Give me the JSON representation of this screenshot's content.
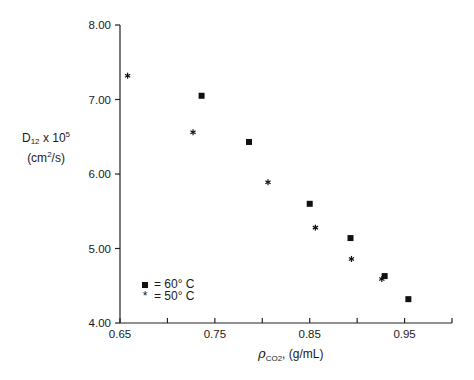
{
  "chart_data": {
    "type": "scatter",
    "title": "",
    "xlabel": "ρCO2, (g/mL)",
    "ylabel": "D12 x 10^5 (cm²/s)",
    "xlim": [
      0.65,
      1.0
    ],
    "ylim": [
      4.0,
      8.0
    ],
    "x_ticks": [
      0.65,
      0.7,
      0.75,
      0.8,
      0.85,
      0.9,
      0.95,
      1.0
    ],
    "x_tick_labels": [
      "0.65",
      "0.75",
      "0.85",
      "0.95"
    ],
    "y_ticks": [
      4.0,
      5.0,
      6.0,
      7.0,
      8.0
    ],
    "y_tick_labels": [
      "4.00",
      "5.00",
      "6.00",
      "7.00",
      "8.00"
    ],
    "grid": false,
    "legend_position": "lower left",
    "series": [
      {
        "name": "60° C",
        "marker": "square",
        "x": [
          0.736,
          0.786,
          0.85,
          0.893,
          0.929,
          0.954
        ],
        "y": [
          7.05,
          6.43,
          5.6,
          5.14,
          4.63,
          4.32
        ]
      },
      {
        "name": "50° C",
        "marker": "star",
        "x": [
          0.658,
          0.727,
          0.806,
          0.856,
          0.894,
          0.926
        ],
        "y": [
          7.32,
          6.56,
          5.89,
          5.28,
          4.86,
          4.59
        ]
      }
    ]
  },
  "labels": {
    "y_main": "D",
    "y_sub": "12",
    "y_mult": " x 10",
    "y_exp": "5",
    "y_units_a": "(cm",
    "y_units_exp": "2",
    "y_units_b": "/s)",
    "x_rho": "ρ",
    "x_sub": "CO2",
    "x_units": ", (g/mL)"
  },
  "legend": {
    "items": [
      {
        "symbol": "■",
        "text": "= 60° C"
      },
      {
        "symbol": "*",
        "text": "= 50° C"
      }
    ]
  }
}
